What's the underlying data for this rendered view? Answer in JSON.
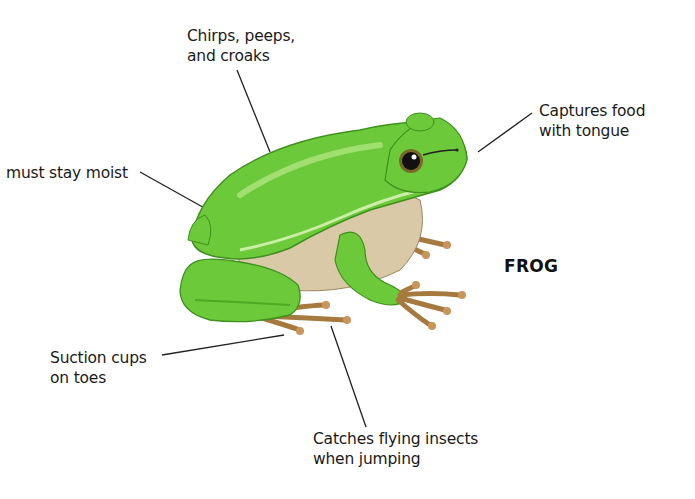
{
  "diagram": {
    "title": "FROG",
    "labels": {
      "sound": {
        "line1": "Chirps, peeps,",
        "line2": "and croaks"
      },
      "skin": {
        "line1": "must stay moist"
      },
      "food": {
        "line1": "Captures food",
        "line2": "with tongue"
      },
      "toes": {
        "line1": "Suction cups",
        "line2": "on toes"
      },
      "jump": {
        "line1": "Catches flying insects",
        "line2": "when jumping"
      }
    },
    "colors": {
      "frog_green": "#6cc93a",
      "frog_light_green": "#b6e887",
      "belly": "#d9c9a6",
      "toes": "#a67a3f",
      "stripe": "#4a3320",
      "leader_line": "#222222"
    }
  }
}
